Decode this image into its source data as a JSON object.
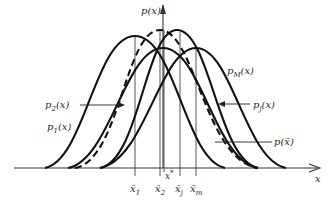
{
  "diagram": {
    "title": "",
    "axes": {
      "y_label": "p(x)",
      "x_label": "x"
    },
    "curves": [
      {
        "id": "p1",
        "label": "p",
        "subscript": "1",
        "suffix": "(x)",
        "style": "solid",
        "peak_x": "x̄1"
      },
      {
        "id": "p2",
        "label": "p",
        "subscript": "2",
        "suffix": "(x)",
        "style": "solid",
        "peak_x": "x̄2"
      },
      {
        "id": "pj",
        "label": "p",
        "subscript": "j",
        "suffix": "(x)",
        "style": "solid",
        "peak_x": "x̄j"
      },
      {
        "id": "pM",
        "label": "p",
        "subscript": "M",
        "suffix": "(x)",
        "style": "solid",
        "peak_x": "x̄m"
      },
      {
        "id": "pbar",
        "label": "p(x̄)",
        "subscript": "",
        "suffix": "",
        "style": "dashed",
        "peak_x": "x*"
      }
    ],
    "markers": [
      {
        "id": "x1",
        "base": "x̄",
        "subscript": "1"
      },
      {
        "id": "x2",
        "base": "x̄",
        "subscript": "2"
      },
      {
        "id": "xstar",
        "base": "x",
        "superscript": "*"
      },
      {
        "id": "xj",
        "base": "x̄",
        "subscript": "j"
      },
      {
        "id": "xm",
        "base": "x̄",
        "subscript": "m"
      }
    ]
  }
}
